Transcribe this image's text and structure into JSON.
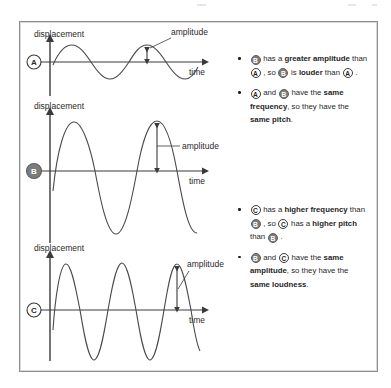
{
  "figure": {
    "border_color": "#8e8e90",
    "background": "#ffffff",
    "line_color": "#3a3a3a"
  },
  "badges": {
    "a": {
      "letter": "A",
      "style": "light",
      "fill": "#ffffff",
      "text_color": "#2a2a2a"
    },
    "b": {
      "letter": "B",
      "style": "dark",
      "fill": "#7c7c7c",
      "text_color": "#ffffff"
    },
    "c": {
      "letter": "C",
      "style": "light",
      "fill": "#ffffff",
      "text_color": "#2a2a2a"
    }
  },
  "graphs": [
    {
      "id": "graph-a",
      "badge": "A",
      "y_axis_label": "displacement",
      "x_axis_label": "time",
      "amplitude_label": "amplitude",
      "cycles": 2,
      "amplitude_relative": 0.33
    },
    {
      "id": "graph-b",
      "badge": "B",
      "y_axis_label": "displacement",
      "x_axis_label": "time",
      "amplitude_label": "amplitude",
      "cycles": 2,
      "amplitude_relative": 1.0
    },
    {
      "id": "graph-c",
      "badge": "C",
      "y_axis_label": "displacement",
      "x_axis_label": "time",
      "amplitude_label": "amplitude",
      "cycles": 4.5,
      "amplitude_relative": 1.0
    }
  ],
  "chart_data": {
    "type": "line",
    "xlabel": "time",
    "ylabel": "displacement",
    "grid": false,
    "legend": "none",
    "series": [
      {
        "name": "A",
        "waveform": "sine",
        "cycles": 2,
        "amplitude": 0.33,
        "frequency_relative": 1,
        "description": "small amplitude, low frequency"
      },
      {
        "name": "B",
        "waveform": "sine",
        "cycles": 2,
        "amplitude": 1.0,
        "frequency_relative": 1,
        "description": "large amplitude, same frequency as A"
      },
      {
        "name": "C",
        "waveform": "sine",
        "cycles": 4.5,
        "amplitude": 1.0,
        "frequency_relative": 2.25,
        "description": "large amplitude, higher frequency than B"
      }
    ]
  },
  "notes": {
    "group_one": [
      {
        "id": "note-amplitude-louder",
        "segments": [
          {
            "type": "badge",
            "letter": "B",
            "style": "dark"
          },
          {
            "type": "text",
            "text": " has a "
          },
          {
            "type": "bold",
            "text": "greater amplitude"
          },
          {
            "type": "text",
            "text": " than "
          },
          {
            "type": "badge",
            "letter": "A",
            "style": "light"
          },
          {
            "type": "text",
            "text": " , so "
          },
          {
            "type": "badge",
            "letter": "B",
            "style": "dark"
          },
          {
            "type": "text",
            "text": " is "
          },
          {
            "type": "bold",
            "text": "louder"
          },
          {
            "type": "text",
            "text": " than "
          },
          {
            "type": "badge",
            "letter": "A",
            "style": "light"
          },
          {
            "type": "text",
            "text": " ."
          }
        ]
      },
      {
        "id": "note-frequency-pitch",
        "segments": [
          {
            "type": "badge",
            "letter": "A",
            "style": "light"
          },
          {
            "type": "text",
            "text": " and "
          },
          {
            "type": "badge",
            "letter": "B",
            "style": "dark"
          },
          {
            "type": "text",
            "text": " have the "
          },
          {
            "type": "bold",
            "text": "same frequency"
          },
          {
            "type": "text",
            "text": ", so they have the "
          },
          {
            "type": "bold",
            "text": "same pitch"
          },
          {
            "type": "text",
            "text": "."
          }
        ]
      }
    ],
    "group_two": [
      {
        "id": "note-higher-frequency",
        "segments": [
          {
            "type": "badge",
            "letter": "C",
            "style": "light"
          },
          {
            "type": "text",
            "text": " has a "
          },
          {
            "type": "bold",
            "text": "higher frequency"
          },
          {
            "type": "text",
            "text": " than "
          },
          {
            "type": "badge",
            "letter": "B",
            "style": "dark"
          },
          {
            "type": "text",
            "text": " , so "
          },
          {
            "type": "badge",
            "letter": "C",
            "style": "light"
          },
          {
            "type": "text",
            "text": " has a "
          },
          {
            "type": "bold",
            "text": "higher pitch"
          },
          {
            "type": "text",
            "text": " than "
          },
          {
            "type": "badge",
            "letter": "B",
            "style": "dark"
          },
          {
            "type": "text",
            "text": " ."
          }
        ]
      },
      {
        "id": "note-same-loudness",
        "segments": [
          {
            "type": "badge",
            "letter": "B",
            "style": "dark"
          },
          {
            "type": "text",
            "text": " and "
          },
          {
            "type": "badge",
            "letter": "C",
            "style": "light"
          },
          {
            "type": "text",
            "text": " have the "
          },
          {
            "type": "bold",
            "text": "same amplitude"
          },
          {
            "type": "text",
            "text": ", so they have the "
          },
          {
            "type": "bold",
            "text": "same loudness"
          },
          {
            "type": "text",
            "text": "."
          }
        ]
      }
    ]
  }
}
